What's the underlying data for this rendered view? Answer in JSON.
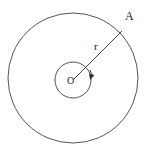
{
  "diagram": {
    "type": "concentric-circles",
    "labels": {
      "point_a": "A",
      "radius": "r",
      "center": "O"
    },
    "colors": {
      "stroke": "#555555",
      "text": "#222222",
      "background": "#ffffff"
    }
  }
}
